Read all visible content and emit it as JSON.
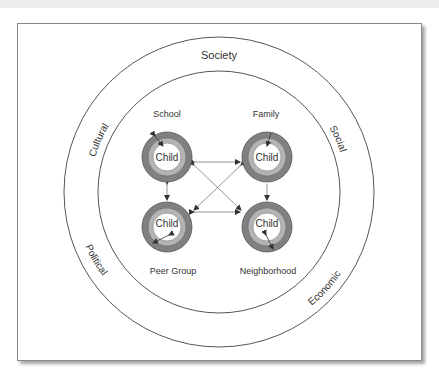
{
  "diagram": {
    "outer_ring_label": "Society",
    "outer_ring_forces": {
      "top_left": "Cultural",
      "top_right": "Social",
      "bottom_left": "Political",
      "bottom_right": "Economic"
    },
    "contexts": [
      {
        "label": "School",
        "center_label": "Child",
        "position": "top-left"
      },
      {
        "label": "Family",
        "center_label": "Child",
        "position": "top-right"
      },
      {
        "label": "Peer Group",
        "center_label": "Child",
        "position": "bottom-left"
      },
      {
        "label": "Neighborhood",
        "center_label": "Child",
        "position": "bottom-right"
      }
    ],
    "colors": {
      "outer_ring": "#808080",
      "middle_ring": "#b3b3b3",
      "inner_ring": "#ffffff",
      "stroke": "#555555"
    }
  }
}
